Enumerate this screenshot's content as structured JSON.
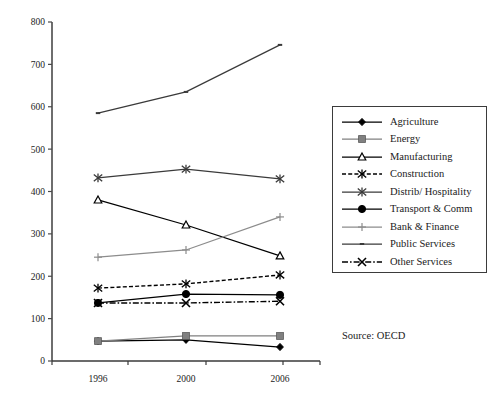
{
  "chart_data": {
    "type": "line",
    "title": "",
    "xlabel": "",
    "ylabel": "",
    "categories": [
      "1996",
      "2000",
      "2006"
    ],
    "ylim": [
      0,
      800
    ],
    "ytick_values": [
      0,
      100,
      200,
      300,
      400,
      500,
      600,
      700,
      800
    ],
    "ytick_labels": [
      "0",
      "100",
      "200",
      "300",
      "400",
      "500",
      "600",
      "700",
      "800"
    ],
    "grid": false,
    "legend_position": "right",
    "series": [
      {
        "name": "Agriculture",
        "values": [
          47,
          50,
          33
        ],
        "marker": "filled-diamond",
        "line": "solid",
        "color": "#000000"
      },
      {
        "name": "Energy",
        "values": [
          47,
          59,
          59
        ],
        "marker": "filled-square",
        "line": "solid",
        "color": "#808080"
      },
      {
        "name": "Manufacturing",
        "values": [
          380,
          321,
          248
        ],
        "marker": "open-triangle",
        "line": "solid",
        "color": "#000000"
      },
      {
        "name": "Construction",
        "values": [
          172,
          182,
          203
        ],
        "marker": "star",
        "line": "dashed",
        "color": "#000000"
      },
      {
        "name": "Distrib/ Hospitality",
        "values": [
          432,
          453,
          430
        ],
        "marker": "star",
        "line": "solid",
        "color": "#3a3a3a"
      },
      {
        "name": "Transport & Comm",
        "values": [
          137,
          158,
          156
        ],
        "marker": "filled-circle",
        "line": "solid",
        "color": "#000000"
      },
      {
        "name": "Bank & Finance",
        "values": [
          245,
          262,
          340
        ],
        "marker": "plus",
        "line": "solid",
        "color": "#8c8c8c"
      },
      {
        "name": "Public Services",
        "values": [
          585,
          635,
          746
        ],
        "marker": "small-dash",
        "line": "solid",
        "color": "#3a3a3a"
      },
      {
        "name": "Other Services",
        "values": [
          137,
          137,
          141
        ],
        "marker": "x-cross",
        "line": "dash-dot",
        "color": "#000000"
      }
    ]
  },
  "legend": {
    "items": [
      {
        "label": "Agriculture"
      },
      {
        "label": "Energy"
      },
      {
        "label": "Manufacturing"
      },
      {
        "label": "Construction"
      },
      {
        "label": "Distrib/ Hospitality"
      },
      {
        "label": "Transport & Comm"
      },
      {
        "label": "Bank & Finance"
      },
      {
        "label": "Public Services"
      },
      {
        "label": "Other Services"
      }
    ]
  },
  "source_note": "Source: OECD"
}
